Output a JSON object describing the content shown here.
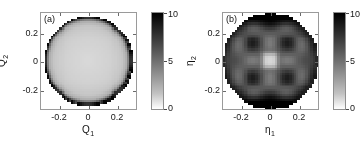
{
  "figure": {
    "background": "#ffffff",
    "colormap": "gray-reversed",
    "panel_count": 2
  },
  "chart_data": [
    {
      "type": "heatmap",
      "panel_label": "(a)",
      "title": "",
      "xlabel": "Q",
      "xlabel_sub": "1",
      "ylabel": "Q",
      "ylabel_sub": "2",
      "xticks": [
        "-0.2",
        "0",
        "0.2"
      ],
      "xtick_values": [
        -0.2,
        0,
        0.2
      ],
      "yticks": [
        "0.2",
        "0",
        "-0.2"
      ],
      "ytick_values": [
        0.2,
        0,
        -0.2
      ],
      "xlim": [
        -0.33,
        0.33
      ],
      "ylim": [
        -0.33,
        0.33
      ],
      "grid": false,
      "colorbar": {
        "min": 0,
        "max": 10,
        "ticks": [
          "10",
          "5",
          "0"
        ],
        "tick_values": [
          10,
          5,
          0
        ],
        "orientation": "vertical",
        "position": "right",
        "high_color": "#000000",
        "low_color": "#ffffff"
      },
      "description": "Nearly uniform low-value disk (value ~1.5-2) with a sharp dark high-value rim (value ~9-10) at radius 0.30; region outside the disk is blank white.",
      "disk_radius": 0.3,
      "interior_value": 1.8,
      "rim_value": 9.5,
      "values_note": "Field sampled on a 46x46 grid over [-0.33,0.33]^2",
      "series": [
        {
          "name": "eta-field-a",
          "radial_profile_r": [
            0.0,
            0.05,
            0.1,
            0.15,
            0.2,
            0.24,
            0.27,
            0.285,
            0.295,
            0.3
          ],
          "radial_profile_value": [
            1.5,
            1.6,
            1.7,
            1.8,
            2.0,
            2.3,
            3.2,
            5.5,
            8.2,
            9.8
          ]
        }
      ]
    },
    {
      "type": "heatmap",
      "panel_label": "(b)",
      "title": "",
      "xlabel": "η",
      "xlabel_sub": "1",
      "ylabel": "η",
      "ylabel_sub": "2",
      "xticks": [
        "-0.2",
        "0",
        "0.2"
      ],
      "xtick_values": [
        -0.2,
        0,
        0.2
      ],
      "yticks": [
        "0.2",
        "0",
        "-0.2"
      ],
      "ytick_values": [
        0.2,
        0,
        -0.2
      ],
      "xlim": [
        -0.33,
        0.33
      ],
      "ylim": [
        -0.33,
        0.33
      ],
      "grid": false,
      "colorbar": {
        "min": 0,
        "max": 10,
        "ticks": [
          "10",
          "5",
          "0"
        ],
        "tick_values": [
          10,
          5,
          0
        ],
        "orientation": "vertical",
        "position": "right",
        "high_color": "#000000",
        "low_color": "#ffffff"
      },
      "description": "Mottled mid-to-dark disk (values ~4-9) with a bright low-value square patch at the centre (value ~1.5), a checkerboard of lighter lobes along the axes, and dark saturated bands at the top, bottom and left/right edges.",
      "disk_radius": 0.32,
      "center_value": 1.6,
      "background_value": 6.5,
      "rim_value": 9.5,
      "values_note": "Field sampled on a 40x40 grid over [-0.33,0.33]^2",
      "series": [
        {
          "name": "eta-field-b",
          "features": [
            {
              "x": 0.0,
              "y": 0.0,
              "value": 1.6,
              "kind": "bright-core"
            },
            {
              "x": 0.0,
              "y": 0.12,
              "value": 5.2,
              "kind": "light-lobe"
            },
            {
              "x": 0.0,
              "y": -0.12,
              "value": 5.4,
              "kind": "light-lobe"
            },
            {
              "x": 0.12,
              "y": 0.0,
              "value": 5.0,
              "kind": "light-lobe"
            },
            {
              "x": -0.12,
              "y": 0.0,
              "value": 5.2,
              "kind": "light-lobe"
            },
            {
              "x": 0.12,
              "y": 0.12,
              "value": 7.6,
              "kind": "dark-lobe"
            },
            {
              "x": -0.12,
              "y": 0.12,
              "value": 7.6,
              "kind": "dark-lobe"
            },
            {
              "x": 0.12,
              "y": -0.12,
              "value": 7.8,
              "kind": "dark-lobe"
            },
            {
              "x": -0.12,
              "y": -0.12,
              "value": 7.8,
              "kind": "dark-lobe"
            },
            {
              "x": 0.0,
              "y": 0.3,
              "value": 9.6,
              "kind": "dark-edge"
            },
            {
              "x": 0.0,
              "y": -0.3,
              "value": 9.8,
              "kind": "dark-edge"
            },
            {
              "x": -0.3,
              "y": 0.0,
              "value": 9.2,
              "kind": "dark-edge"
            },
            {
              "x": 0.3,
              "y": 0.0,
              "value": 9.2,
              "kind": "dark-edge"
            }
          ]
        }
      ]
    }
  ]
}
